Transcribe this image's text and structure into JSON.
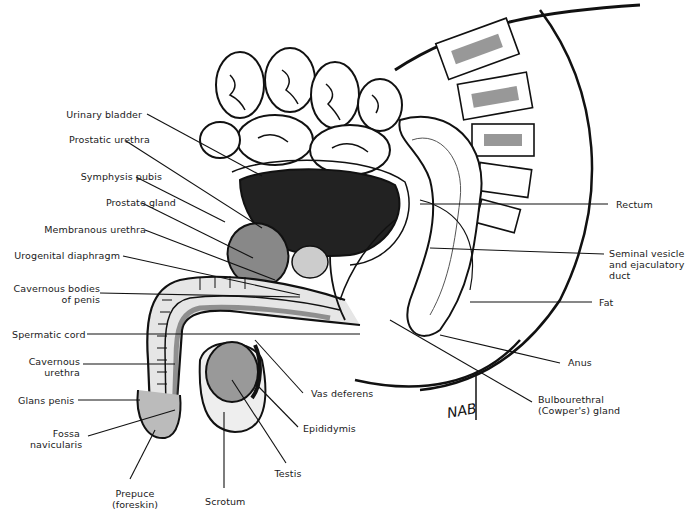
{
  "figure": {
    "signature": "NAB",
    "labels": [
      {
        "id": "urinary-bladder",
        "text": "Urinary bladder",
        "x": 32,
        "y": 109,
        "align": "r",
        "w": 110,
        "line": [
          147,
          114,
          262,
          176
        ]
      },
      {
        "id": "prostatic-urethra",
        "text": "Prostatic urethra",
        "x": 40,
        "y": 134,
        "align": "r",
        "w": 110,
        "line": [
          126,
          141,
          262,
          228
        ]
      },
      {
        "id": "symphysis-pubis",
        "text": "Symphysis pubis",
        "x": 52,
        "y": 171,
        "align": "r",
        "w": 110,
        "line": [
          136,
          177,
          225,
          222
        ]
      },
      {
        "id": "prostate-gland",
        "text": "Prostate gland",
        "x": 66,
        "y": 197,
        "align": "r",
        "w": 110,
        "line": [
          142,
          203,
          253,
          258
        ]
      },
      {
        "id": "membranous-urethra",
        "text": "Membranous urethra",
        "x": 36,
        "y": 224,
        "align": "r",
        "w": 110,
        "line": [
          145,
          230,
          275,
          280
        ]
      },
      {
        "id": "urogenital-diaphragm",
        "text": "Urogenital diaphragm",
        "x": 10,
        "y": 250,
        "align": "r",
        "w": 110,
        "line": [
          123,
          256,
          300,
          295
        ]
      },
      {
        "id": "cavernous-bodies",
        "text": "Cavernous bodies\nof penis",
        "x": 10,
        "y": 283,
        "align": "r",
        "w": 90,
        "line": [
          100,
          293,
          300,
          297
        ]
      },
      {
        "id": "spermatic-cord",
        "text": "Spermatic cord",
        "x": 12,
        "y": 329,
        "align": "r",
        "w": 70,
        "line": [
          87,
          334,
          360,
          334
        ]
      },
      {
        "id": "cavernous-urethra",
        "text": "Cavernous\nurethra",
        "x": 28,
        "y": 356,
        "align": "r",
        "w": 52,
        "line": [
          83,
          364,
          175,
          364
        ]
      },
      {
        "id": "glans-penis",
        "text": "Glans penis",
        "x": 18,
        "y": 395,
        "align": "r",
        "w": 56,
        "line": [
          78,
          400,
          140,
          400
        ]
      },
      {
        "id": "fossa-navicularis",
        "text": "Fossa\nnavicularis",
        "x": 30,
        "y": 428,
        "align": "r",
        "w": 50,
        "line": [
          88,
          436,
          175,
          410
        ]
      },
      {
        "id": "prepuce",
        "text": "Prepuce\n(foreskin)",
        "x": 110,
        "y": 488,
        "align": "c",
        "w": 50,
        "line": [
          130,
          479,
          155,
          430
        ]
      },
      {
        "id": "scrotum",
        "text": "Scrotum",
        "x": 205,
        "y": 496,
        "align": "c",
        "w": 40,
        "line": [
          224,
          488,
          224,
          412
        ]
      },
      {
        "id": "testis",
        "text": "Testis",
        "x": 273,
        "y": 468,
        "align": "c",
        "w": 30,
        "line": [
          286,
          463,
          232,
          380
        ]
      },
      {
        "id": "epididymis",
        "text": "Epididymis",
        "x": 303,
        "y": 423,
        "align": "l",
        "w": 60,
        "line": [
          298,
          427,
          256,
          384
        ]
      },
      {
        "id": "vas-deferens",
        "text": "Vas deferens",
        "x": 311,
        "y": 388,
        "align": "l",
        "w": 70,
        "line": [
          303,
          393,
          255,
          340
        ]
      },
      {
        "id": "bulbourethral-gland",
        "text": "Bulbourethral\n(Cowper's) gland",
        "x": 538,
        "y": 394,
        "align": "l",
        "w": 90,
        "line": [
          532,
          402,
          390,
          320
        ]
      },
      {
        "id": "anus",
        "text": "Anus",
        "x": 568,
        "y": 357,
        "align": "l",
        "w": 30,
        "line": [
          560,
          363,
          440,
          335
        ]
      },
      {
        "id": "fat",
        "text": "Fat",
        "x": 599,
        "y": 297,
        "align": "l",
        "w": 30,
        "line": [
          592,
          302,
          470,
          302
        ]
      },
      {
        "id": "seminal-vesicle",
        "text": "Seminal vesicle\nand ejaculatory\nduct",
        "x": 609,
        "y": 248,
        "align": "l",
        "w": 80,
        "line": [
          604,
          254,
          430,
          248
        ]
      },
      {
        "id": "rectum",
        "text": "Rectum",
        "x": 616,
        "y": 199,
        "align": "l",
        "w": 40,
        "line": [
          608,
          204,
          420,
          204
        ]
      }
    ]
  }
}
